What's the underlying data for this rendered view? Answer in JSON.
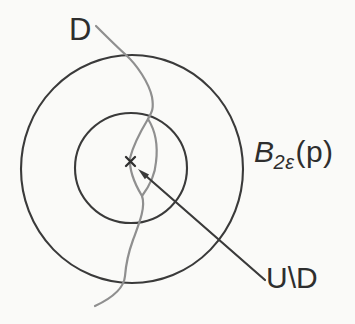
{
  "diagram": {
    "background_color": "#fafaf8",
    "ink_color": "#3a3a3a",
    "curve_color": "#8f8f8f",
    "labels": {
      "curve": "D",
      "ball_base": "B",
      "ball_subscript": "2ε",
      "ball_argument": "(p)",
      "region": "U\\D"
    },
    "center_marker": "x"
  }
}
